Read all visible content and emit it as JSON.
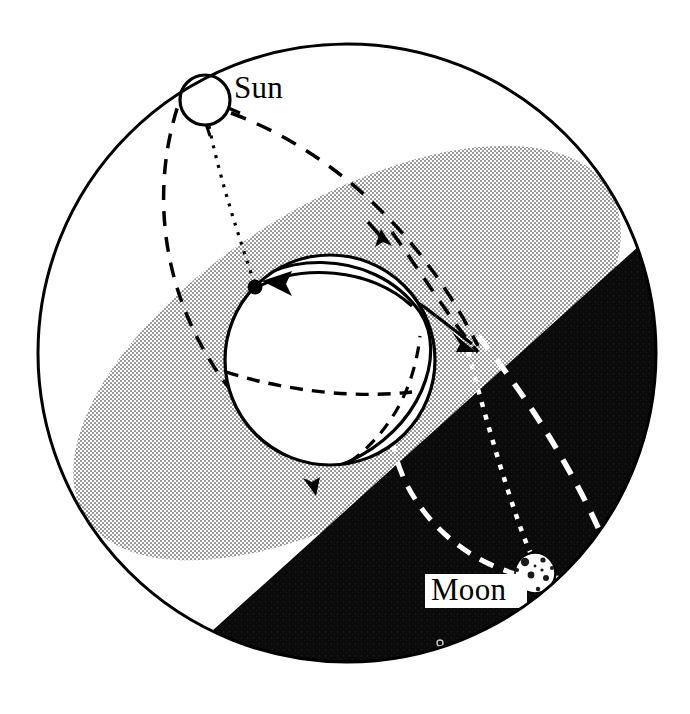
{
  "figure": {
    "background_color": "#ffffff",
    "width": 690,
    "height": 714
  },
  "colors": {
    "ink": "#000000",
    "paper": "#ffffff",
    "shaded_band": "#b9b9b9",
    "dark_hemisphere": "#0a0a0a",
    "halftone_gray": "#c4c4c4"
  },
  "celestial_sphere": {
    "name": "outer-celestial-sphere",
    "center_x": 347,
    "center_y": 353,
    "radius": 309,
    "stroke_width": 3
  },
  "labels": [
    {
      "id": "sun-label",
      "text": "Sun",
      "x": 234,
      "y": 98,
      "boxed": false,
      "color": "#000000"
    },
    {
      "id": "moon-label",
      "text": "Moon",
      "x": 431,
      "y": 599,
      "boxed": true,
      "color": "#000000"
    }
  ],
  "bodies": {
    "sun": {
      "name": "sun-disc",
      "label": "Sun",
      "center_x": 205,
      "center_y": 100,
      "radius": 25,
      "fill": "#ffffff",
      "stroke": "#000000"
    },
    "earth": {
      "name": "earth-globe",
      "label": "Earth",
      "center_x": 330,
      "center_y": 360,
      "radius": 105,
      "fill": "#ffffff",
      "stroke": "#000000"
    },
    "moon": {
      "name": "moon-disc",
      "label": "Moon",
      "center_x": 535,
      "center_y": 573,
      "radius": 20,
      "fill": "#ffffff",
      "stroke": "#000000",
      "texture": "cratered"
    },
    "star_marker": {
      "name": "tiny-star-marker",
      "center_x": 440,
      "center_y": 643,
      "radius": 3
    }
  },
  "markers": {
    "node_dot": {
      "name": "orbital-node-dot",
      "x": 255,
      "y": 287,
      "radius": 7
    },
    "arrowheads": [
      {
        "name": "arrowhead-equator-west",
        "x": 272,
        "y": 282,
        "angle": 200
      },
      {
        "name": "arrowhead-globe-north",
        "x": 386,
        "y": 240,
        "angle": 285
      },
      {
        "name": "arrowhead-globe-south",
        "x": 311,
        "y": 484,
        "angle": 105
      },
      {
        "name": "arrowhead-ecliptic-east",
        "x": 449,
        "y": 341,
        "angle": 55
      }
    ]
  },
  "regions": [
    {
      "name": "shaded-ecliptic-band",
      "description": "halftone grey elliptical band crossing the sphere",
      "fill": "#c4c4c4"
    },
    {
      "name": "dark-night-hemisphere",
      "description": "black region filling lower-right of the celestial sphere",
      "fill": "#0a0a0a"
    }
  ],
  "line_styles": {
    "solid": "solid",
    "long_dash": "dashed",
    "fine_dot": "dotted",
    "white_long_dash": "dashed-white",
    "white_fine_dot": "dotted-white"
  },
  "paths": [
    {
      "name": "sun-meridian-dashed-west",
      "style": "long_dash",
      "from": "sun",
      "to": "sphere-rim-left"
    },
    {
      "name": "sun-to-node-dotted",
      "style": "fine_dot",
      "from": "sun",
      "to": "orbital-node-dot"
    },
    {
      "name": "sun-ecliptic-dashed-east",
      "style": "long_dash",
      "from": "sun",
      "to": "sphere-rim-right"
    },
    {
      "name": "earth-equator-dashed",
      "style": "long_dash",
      "from": "globe-west",
      "to": "globe-east"
    },
    {
      "name": "earth-horizon-solid",
      "style": "solid",
      "from": "globe-west",
      "to": "globe-east"
    },
    {
      "name": "moon-orbit-dashed-white",
      "style": "white_long_dash",
      "from": "sphere-interior",
      "to": "moon"
    },
    {
      "name": "moon-meridian-dotted-white",
      "style": "white_fine_dot",
      "from": "globe-east",
      "to": "moon"
    },
    {
      "name": "moon-ecliptic-dashed-white",
      "style": "white_long_dash",
      "from": "moon",
      "to": "sphere-rim-right"
    }
  ]
}
